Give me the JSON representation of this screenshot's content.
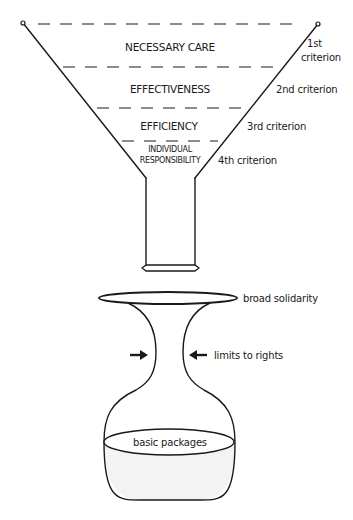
{
  "funnel": {
    "levels": [
      {
        "label": "NECESSARY CARE",
        "criterion": [
          "1st",
          "criterion"
        ]
      },
      {
        "label": "EFFECTIVENESS",
        "criterion": "2nd criterion"
      },
      {
        "label": "EFFICIENCY",
        "criterion": "3rd criterion"
      },
      {
        "label": [
          "INDIVIDUAL",
          "RESPONSIBILITY"
        ],
        "criterion": "4th criterion"
      }
    ]
  },
  "vase": {
    "rim_label": "broad solidarity",
    "neck_label": "limits to rights",
    "contents_label": "basic packages"
  },
  "colors": {
    "line": "#1a1a1a",
    "background": "#ffffff",
    "liquid": "#f3f3f3"
  }
}
